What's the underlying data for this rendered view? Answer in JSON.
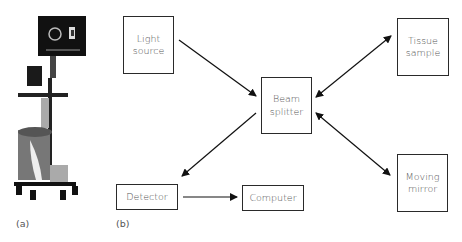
{
  "figure": {
    "panel_a": {
      "label": "(a)",
      "image_description": "medical imaging cart with monitor"
    },
    "panel_b": {
      "label": "(b)",
      "nodes": {
        "light_source": "Light\nsource",
        "beam_splitter": "Beam\nsplitter",
        "tissue_sample": "Tissue\nsample",
        "moving_mirror": "Moving\nmirror",
        "detector": "Detector",
        "computer": "Computer"
      },
      "edges": [
        {
          "from": "Light source",
          "to": "Beam splitter",
          "direction": "one-way"
        },
        {
          "from": "Beam splitter",
          "to": "Tissue sample",
          "direction": "two-way"
        },
        {
          "from": "Beam splitter",
          "to": "Moving mirror",
          "direction": "two-way"
        },
        {
          "from": "Beam splitter",
          "to": "Detector",
          "direction": "one-way"
        },
        {
          "from": "Detector",
          "to": "Computer",
          "direction": "one-way"
        }
      ]
    }
  }
}
